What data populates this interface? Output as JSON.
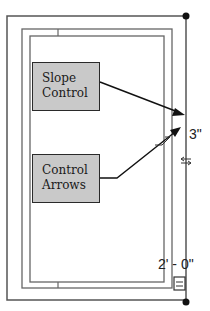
{
  "callouts": {
    "slope_control": {
      "line1": "Slope",
      "line2": "Control"
    },
    "control_arrows": {
      "line1": "Control",
      "line2": "Arrows"
    }
  },
  "dimensions": {
    "right_offset": "3\"",
    "bottom_label": "2' - 0\""
  },
  "colors": {
    "line": "#555555",
    "callout_fill": "#c9c9c9",
    "arrow": "#111111"
  }
}
